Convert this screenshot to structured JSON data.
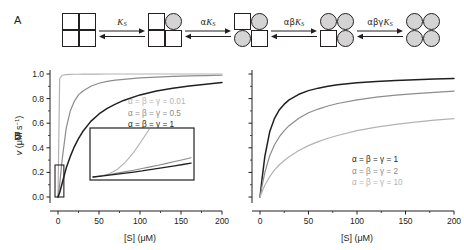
{
  "panels": {
    "a": {
      "letter": "A",
      "states": [
        {
          "name": "state-0-ligands",
          "subunits": [
            "sq",
            "sq",
            "sq",
            "sq"
          ]
        },
        {
          "name": "state-1-ligand",
          "subunits": [
            "sq",
            "ci",
            "sq",
            "sq"
          ]
        },
        {
          "name": "state-2-ligands",
          "subunits": [
            "sq",
            "ci",
            "ci",
            "sq"
          ]
        },
        {
          "name": "state-3-ligands",
          "subunits": [
            "ci",
            "ci",
            "sq",
            "ci"
          ]
        },
        {
          "name": "state-4-ligands",
          "subunits": [
            "ci",
            "ci",
            "ci",
            "ci"
          ]
        }
      ],
      "equilibria": [
        {
          "label": "K_S",
          "greek": "",
          "base": "K",
          "sub": "S"
        },
        {
          "label": "aK_S",
          "greek": "α",
          "base": "K",
          "sub": "S"
        },
        {
          "label": "abK_S",
          "greek": "αβ",
          "base": "K",
          "sub": "S"
        },
        {
          "label": "abgK_S",
          "greek": "αβγ",
          "base": "K",
          "sub": "S"
        }
      ]
    },
    "b": {
      "letter": "B",
      "legend": [
        {
          "text": "α = β = γ = 0.01",
          "color": "#b3b3b3"
        },
        {
          "text": "α = β = γ = 0.5",
          "color": "#8c8c8c"
        },
        {
          "text": "α = β = γ = 1",
          "color": "#231f20"
        }
      ],
      "inset": {
        "name": "low-substrate-inset"
      }
    },
    "c": {
      "letter": "C",
      "legend": [
        {
          "text": "α = β = γ = 1",
          "color": "#231f20"
        },
        {
          "text": "α = β = γ = 2",
          "color": "#8c8c8c"
        },
        {
          "text": "α = β = γ = 10",
          "color": "#b3b3b3"
        }
      ]
    }
  },
  "chart_data": [
    {
      "type": "line",
      "name": "panel-b",
      "title": "",
      "xlabel": "[S] (μM)",
      "ylabel": "v (μM s⁻¹)",
      "xlim": [
        0,
        200
      ],
      "ylim": [
        0.0,
        1.0
      ],
      "xticks": [
        0,
        50,
        100,
        150,
        200
      ],
      "yticks": [
        "0.0",
        "0.2",
        "0.4",
        "0.6",
        "0.8",
        "1.0"
      ],
      "grid": false,
      "legend_position": "upper-right-inside",
      "x": [
        0,
        2,
        5,
        10,
        15,
        20,
        25,
        30,
        40,
        50,
        60,
        70,
        80,
        100,
        120,
        140,
        160,
        180,
        200
      ],
      "series": [
        {
          "name": "α = β = γ = 0.01",
          "color": "#b3b3b3",
          "values": [
            0,
            0.96,
            0.99,
            0.995,
            0.997,
            0.998,
            0.998,
            0.999,
            0.999,
            0.999,
            1.0,
            1.0,
            1.0,
            1.0,
            1.0,
            1.0,
            1.0,
            1.0,
            1.0
          ]
        },
        {
          "name": "α = β = γ = 0.5",
          "color": "#8c8c8c",
          "values": [
            0,
            0.1,
            0.3,
            0.56,
            0.7,
            0.78,
            0.83,
            0.86,
            0.9,
            0.925,
            0.94,
            0.95,
            0.957,
            0.968,
            0.975,
            0.98,
            0.984,
            0.987,
            0.99
          ]
        },
        {
          "name": "α = β = γ = 1",
          "color": "#231f20",
          "values": [
            0,
            0.035,
            0.11,
            0.235,
            0.33,
            0.41,
            0.475,
            0.53,
            0.615,
            0.675,
            0.72,
            0.755,
            0.785,
            0.83,
            0.862,
            0.885,
            0.903,
            0.917,
            0.93
          ]
        }
      ]
    },
    {
      "type": "line",
      "name": "panel-c",
      "title": "",
      "xlabel": "[S] (μM)",
      "ylabel": "",
      "xlim": [
        0,
        200
      ],
      "ylim": [
        0.0,
        1.0
      ],
      "xticks": [
        0,
        50,
        100,
        150,
        200
      ],
      "yticks": [],
      "grid": false,
      "legend_position": "lower-right-inside",
      "x": [
        0,
        2,
        5,
        10,
        15,
        20,
        25,
        30,
        40,
        50,
        60,
        70,
        80,
        100,
        120,
        140,
        160,
        180,
        200
      ],
      "series": [
        {
          "name": "α = β = γ = 1",
          "color": "#231f20",
          "values": [
            0,
            0.14,
            0.33,
            0.53,
            0.64,
            0.71,
            0.755,
            0.79,
            0.835,
            0.865,
            0.885,
            0.9,
            0.912,
            0.928,
            0.94,
            0.948,
            0.954,
            0.959,
            0.963
          ]
        },
        {
          "name": "α = β = γ = 2",
          "color": "#8c8c8c",
          "values": [
            0,
            0.085,
            0.2,
            0.335,
            0.425,
            0.49,
            0.54,
            0.58,
            0.64,
            0.685,
            0.715,
            0.74,
            0.76,
            0.79,
            0.812,
            0.828,
            0.841,
            0.851,
            0.86
          ]
        },
        {
          "name": "α = β = γ = 10",
          "color": "#b3b3b3",
          "values": [
            0,
            0.04,
            0.095,
            0.165,
            0.22,
            0.262,
            0.297,
            0.328,
            0.378,
            0.418,
            0.45,
            0.478,
            0.5,
            0.539,
            0.568,
            0.591,
            0.609,
            0.625,
            0.638
          ]
        }
      ]
    },
    {
      "type": "line",
      "name": "panel-b-inset",
      "title": "",
      "xlabel": "",
      "ylabel": "",
      "xlim": [
        0,
        3
      ],
      "ylim": [
        0,
        0.25
      ],
      "xticks": [],
      "yticks": [],
      "grid": false,
      "legend_position": "none",
      "x": [
        0,
        0.25,
        0.5,
        0.75,
        1,
        1.25,
        1.5,
        1.75,
        2,
        2.25,
        2.5,
        2.75,
        3
      ],
      "series": [
        {
          "name": "α = β = γ = 0.01",
          "color": "#b3b3b3",
          "values": [
            0,
            0.005,
            0.018,
            0.042,
            0.082,
            0.135,
            0.2,
            0.268,
            0.33,
            0.39,
            0.44,
            0.48,
            0.52
          ]
        },
        {
          "name": "α = β = γ = 0.5",
          "color": "#8c8c8c",
          "values": [
            0,
            0.0065,
            0.0135,
            0.021,
            0.029,
            0.037,
            0.046,
            0.055,
            0.064,
            0.074,
            0.084,
            0.094,
            0.105
          ]
        },
        {
          "name": "α = β = γ = 1",
          "color": "#231f20",
          "values": [
            0,
            0.005,
            0.0105,
            0.016,
            0.0215,
            0.027,
            0.033,
            0.04,
            0.047,
            0.054,
            0.061,
            0.068,
            0.076
          ]
        }
      ]
    }
  ]
}
